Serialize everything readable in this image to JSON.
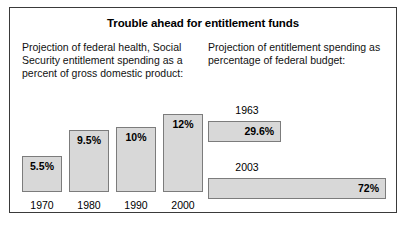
{
  "figure": {
    "title": "Trouble ahead for entitlement funds"
  },
  "panels": {
    "left": {
      "caption": "Projection of federal health, Social Security entitlement spending as a percent of gross domestic product:"
    },
    "right": {
      "caption": "Projection of entitlement spending as percentage of federal budget:"
    }
  },
  "colors": {
    "bar_fill": "#d8d8d8",
    "bar_border": "#7c7c7c",
    "frame_border": "#3a3a3a",
    "background": "#ffffff",
    "text": "#000000"
  },
  "chart_data": [
    {
      "type": "bar",
      "title": "Projection of federal health, Social Security entitlement spending as a percent of gross domestic product:",
      "orientation": "vertical",
      "categories": [
        "1970",
        "1980",
        "1990",
        "2000"
      ],
      "values": [
        5.5,
        9.5,
        10,
        12
      ],
      "value_labels": [
        "5.5%",
        "9.5%",
        "10%",
        "12%"
      ],
      "xlabel": "",
      "ylabel": "",
      "ylim": [
        0,
        12
      ],
      "grid": false,
      "legend": "none",
      "unit": "percent of gross domestic product"
    },
    {
      "type": "bar",
      "title": "Projection of entitlement spending as percentage of federal budget:",
      "orientation": "horizontal",
      "categories": [
        "1963",
        "2003"
      ],
      "values": [
        29.6,
        72
      ],
      "value_labels": [
        "29.6%",
        "72%"
      ],
      "xlabel": "",
      "ylabel": "",
      "xlim": [
        0,
        72
      ],
      "grid": false,
      "legend": "none",
      "unit": "percentage of federal budget"
    }
  ]
}
